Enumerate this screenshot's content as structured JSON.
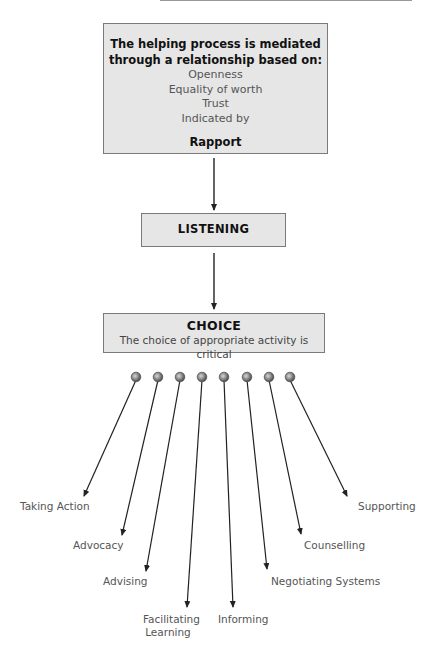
{
  "diagram": {
    "relationship_box": {
      "heading_line1": "The helping process is mediated",
      "heading_line2": "through a relationship based on:",
      "items": [
        "Openness",
        "Equality of worth",
        "Trust",
        "Indicated by"
      ],
      "emphasis": "Rapport"
    },
    "listening_box": {
      "label": "LISTENING"
    },
    "choice_box": {
      "title": "CHOICE",
      "subtitle": "The choice of appropriate activity is critical"
    },
    "activities": [
      {
        "label": "Taking Action"
      },
      {
        "label": "Advocacy"
      },
      {
        "label": "Advising"
      },
      {
        "label_line1": "Facilitating",
        "label_line2": "Learning"
      },
      {
        "label": "Informing"
      },
      {
        "label": "Negotiating Systems"
      },
      {
        "label": "Counselling"
      },
      {
        "label": "Supporting"
      }
    ],
    "colors": {
      "box_fill": "#e6e6e6",
      "box_border": "#7a7a7a",
      "arrow": "#222222",
      "dot": "#8a8a8a"
    }
  }
}
